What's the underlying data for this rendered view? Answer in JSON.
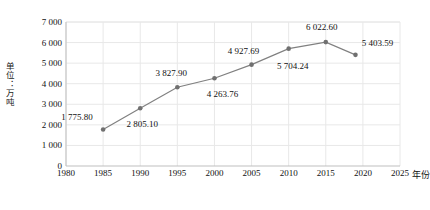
{
  "chart_data": {
    "type": "line",
    "title": "",
    "subtitle": "",
    "xlabel": "年份",
    "ylabel": "单位：万吨",
    "x": [
      1985,
      1990,
      1995,
      2000,
      2005,
      2010,
      2015,
      2019
    ],
    "values": [
      1775.8,
      2805.1,
      3827.9,
      4263.76,
      4927.69,
      5704.24,
      6022.6,
      5403.59
    ],
    "point_labels": [
      "1 775.80",
      "2 805.10",
      "3 827.90",
      "4 263.76",
      "4 927.69",
      "5 704.24",
      "6 022.60",
      "5 403.59"
    ],
    "xlim": [
      1980,
      2025
    ],
    "ylim": [
      0,
      7000
    ],
    "ytick_values": [
      0,
      1000,
      2000,
      3000,
      4000,
      5000,
      6000,
      7000
    ],
    "ytick_labels": [
      "0",
      "1 000",
      "2 000",
      "3 000",
      "4 000",
      "5 000",
      "6 000",
      "7 000"
    ],
    "xtick_values": [
      1980,
      1985,
      1990,
      1995,
      2000,
      2005,
      2010,
      2015,
      2020,
      2025
    ],
    "xtick_labels": [
      "1980",
      "1985",
      "1990",
      "1995",
      "2000",
      "2005",
      "2010",
      "2015",
      "2020",
      "2025"
    ],
    "grid": true,
    "legend": "none",
    "series_color": "#808080",
    "marker_color": "#707070",
    "grid_color": "#e8e8e8",
    "axis_color": "#bfbfbf",
    "label_offsets": [
      {
        "dx": -26,
        "dy": -12
      },
      {
        "dx": 2,
        "dy": 16
      },
      {
        "dx": -6,
        "dy": -14
      },
      {
        "dx": 8,
        "dy": 16
      },
      {
        "dx": -8,
        "dy": -14
      },
      {
        "dx": 4,
        "dy": 17
      },
      {
        "dx": -4,
        "dy": -15
      },
      {
        "dx": 22,
        "dy": -12
      }
    ]
  },
  "axes": {
    "y_axis_title": "单位：万吨",
    "x_axis_unit_suffix": "年份"
  }
}
